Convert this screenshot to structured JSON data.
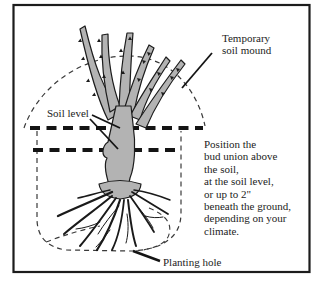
{
  "diagram": {
    "labels": {
      "temporary_soil_mound_line1": "Temporary",
      "temporary_soil_mound_line2": "soil mound",
      "soil_level": "Soil level",
      "planting_hole": "Planting hole"
    },
    "annotation_lines": [
      "Position the",
      "bud union above",
      "the soil,",
      "at the soil level,",
      "or up to 2\"",
      "beneath the ground,",
      "depending on your",
      "climate."
    ],
    "colors": {
      "ink": "#1c1c1c",
      "cane_fill": "#b3b3b3",
      "background": "#ffffff"
    }
  }
}
